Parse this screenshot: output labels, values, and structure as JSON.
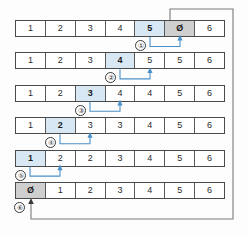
{
  "diagram": {
    "colors": {
      "highlight": "#d7e8f4",
      "zero_cell": "#cfcfcf",
      "arrow": "#4a90c8",
      "wire": "#7a7a7a",
      "cell_border": "#5a5a5a",
      "row_border": "#4a4a4a",
      "text": "#2b2b2b",
      "background": "#fdfdfd"
    },
    "columns": 7,
    "rows": [
      {
        "step": "①",
        "cells": [
          {
            "value": "1",
            "state": "normal"
          },
          {
            "value": "2",
            "state": "normal"
          },
          {
            "value": "3",
            "state": "normal"
          },
          {
            "value": "4",
            "state": "normal"
          },
          {
            "value": "5",
            "state": "highlight"
          },
          {
            "value": "Ø",
            "state": "zero"
          },
          {
            "value": "6",
            "state": "normal"
          }
        ],
        "move_from": 4,
        "move_to": 5
      },
      {
        "step": "②",
        "cells": [
          {
            "value": "1",
            "state": "normal"
          },
          {
            "value": "2",
            "state": "normal"
          },
          {
            "value": "3",
            "state": "normal"
          },
          {
            "value": "4",
            "state": "highlight"
          },
          {
            "value": "5",
            "state": "normal"
          },
          {
            "value": "5",
            "state": "normal"
          },
          {
            "value": "6",
            "state": "normal"
          }
        ],
        "move_from": 3,
        "move_to": 4
      },
      {
        "step": "③",
        "cells": [
          {
            "value": "1",
            "state": "normal"
          },
          {
            "value": "2",
            "state": "normal"
          },
          {
            "value": "3",
            "state": "highlight"
          },
          {
            "value": "4",
            "state": "normal"
          },
          {
            "value": "4",
            "state": "normal"
          },
          {
            "value": "5",
            "state": "normal"
          },
          {
            "value": "6",
            "state": "normal"
          }
        ],
        "move_from": 2,
        "move_to": 3
      },
      {
        "step": "④",
        "cells": [
          {
            "value": "1",
            "state": "normal"
          },
          {
            "value": "2",
            "state": "highlight"
          },
          {
            "value": "3",
            "state": "normal"
          },
          {
            "value": "3",
            "state": "normal"
          },
          {
            "value": "4",
            "state": "normal"
          },
          {
            "value": "5",
            "state": "normal"
          },
          {
            "value": "6",
            "state": "normal"
          }
        ],
        "move_from": 1,
        "move_to": 2
      },
      {
        "step": "⑤",
        "cells": [
          {
            "value": "1",
            "state": "highlight"
          },
          {
            "value": "2",
            "state": "normal"
          },
          {
            "value": "2",
            "state": "normal"
          },
          {
            "value": "3",
            "state": "normal"
          },
          {
            "value": "4",
            "state": "normal"
          },
          {
            "value": "5",
            "state": "normal"
          },
          {
            "value": "6",
            "state": "normal"
          }
        ],
        "move_from": 0,
        "move_to": 1
      },
      {
        "step": "⑥",
        "cells": [
          {
            "value": "Ø",
            "state": "zero"
          },
          {
            "value": "1",
            "state": "normal"
          },
          {
            "value": "2",
            "state": "normal"
          },
          {
            "value": "3",
            "state": "normal"
          },
          {
            "value": "4",
            "state": "normal"
          },
          {
            "value": "5",
            "state": "normal"
          },
          {
            "value": "6",
            "state": "normal"
          }
        ],
        "move_from": null,
        "move_to": 0
      }
    ]
  }
}
